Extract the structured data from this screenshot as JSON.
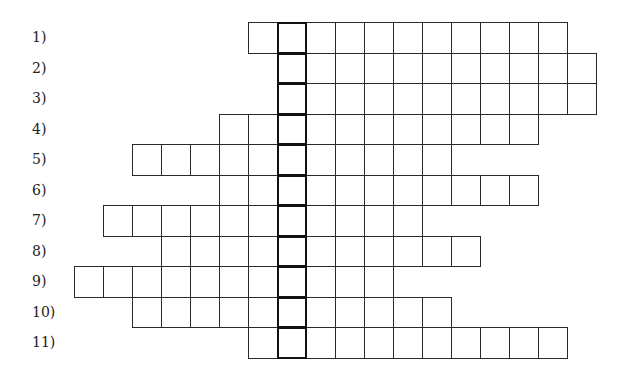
{
  "puzzle": {
    "type": "crossword-keyword",
    "cell_width": 29,
    "row_height": 30.5,
    "grid_left": 74,
    "grid_top": 22,
    "highlight_column": 7,
    "rows": [
      {
        "label": "1)",
        "start_col": 6,
        "length": 11
      },
      {
        "label": "2)",
        "start_col": 7,
        "length": 11
      },
      {
        "label": "3)",
        "start_col": 7,
        "length": 11
      },
      {
        "label": "4)",
        "start_col": 5,
        "length": 11
      },
      {
        "label": "5)",
        "start_col": 2,
        "length": 11
      },
      {
        "label": "6)",
        "start_col": 5,
        "length": 11
      },
      {
        "label": "7)",
        "start_col": 1,
        "length": 11
      },
      {
        "label": "8)",
        "start_col": 3,
        "length": 11
      },
      {
        "label": "9)",
        "start_col": 0,
        "length": 11
      },
      {
        "label": "10)",
        "start_col": 2,
        "length": 11
      },
      {
        "label": "11)",
        "start_col": 6,
        "length": 11
      }
    ]
  },
  "colors": {
    "border": "#2a2a2a",
    "highlight_border": "#111111",
    "background": "#ffffff"
  }
}
